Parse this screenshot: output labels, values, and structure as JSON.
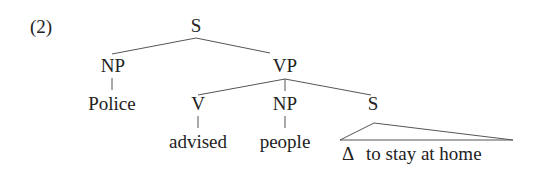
{
  "example_number": "(2)",
  "tree": {
    "root": {
      "label": "S"
    },
    "subject": {
      "label": "NP",
      "word": "Police"
    },
    "predicate": {
      "label": "VP",
      "verb": {
        "label": "V",
        "word": "advised"
      },
      "object": {
        "label": "NP",
        "word": "people"
      },
      "complement": {
        "label": "S",
        "empty_subject": "Δ",
        "text": "to stay at home"
      }
    }
  }
}
